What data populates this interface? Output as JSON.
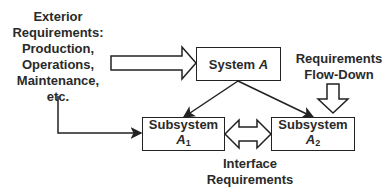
{
  "exterior": {
    "lines": [
      "Exterior",
      "Requirements:",
      "Production,",
      "Operations,",
      "Maintenance,",
      "etc."
    ]
  },
  "system_a": {
    "label": "System",
    "var": "A"
  },
  "subsystem_a1": {
    "label": "Subsystem",
    "var": "A",
    "sub": "1"
  },
  "subsystem_a2": {
    "label": "Subsystem",
    "var": "A",
    "sub": "2"
  },
  "flowdown": {
    "lines": [
      "Requirements",
      "Flow-Down"
    ]
  },
  "interface": {
    "lines": [
      "Interface",
      "Requirements"
    ]
  },
  "colors": {
    "stroke": "#222222",
    "text": "#2a2a2a",
    "background": "#ffffff"
  }
}
